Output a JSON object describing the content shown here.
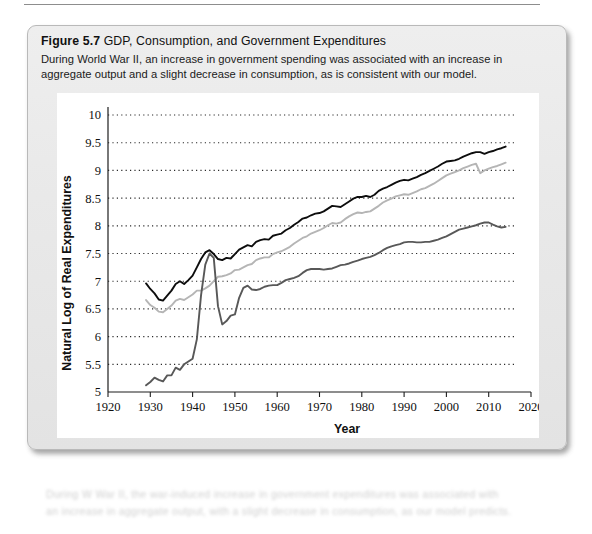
{
  "figure": {
    "number": "Figure 5.7",
    "title": "GDP, Consumption, and Government Expenditures",
    "description": "During World War II, an increase in government spending was associated with an increase in aggregate output and a slight decrease in consumption, as is consistent with our model."
  },
  "footer": {
    "line1": "During W War II, the war-induced increase in government expenditures was associated with",
    "line2": "an increase in aggregate output, with a slight decrease in consumption, as our model predicts."
  },
  "chart_data": {
    "type": "line",
    "title": "GDP, Consumption, and Government Expenditures",
    "xlabel": "Year",
    "ylabel": "Natural Log of Real Expenditures",
    "xlim": [
      1920,
      2020
    ],
    "ylim": [
      5,
      10
    ],
    "xticks": [
      1920,
      1930,
      1940,
      1950,
      1960,
      1970,
      1980,
      1990,
      2000,
      2010,
      2020
    ],
    "yticks": [
      5,
      5.5,
      6,
      6.5,
      7,
      7.5,
      8,
      8.5,
      9,
      9.5,
      10
    ],
    "grid": "horizontal-dotted",
    "legend": "none",
    "series": [
      {
        "name": "GDP",
        "color": "#0d0d0d",
        "width": 1.9,
        "x": [
          1929,
          1930,
          1931,
          1932,
          1933,
          1934,
          1935,
          1936,
          1937,
          1938,
          1939,
          1940,
          1941,
          1942,
          1943,
          1944,
          1945,
          1946,
          1947,
          1948,
          1949,
          1950,
          1951,
          1952,
          1953,
          1954,
          1955,
          1956,
          1957,
          1958,
          1959,
          1960,
          1961,
          1962,
          1963,
          1964,
          1965,
          1966,
          1967,
          1968,
          1969,
          1970,
          1971,
          1972,
          1973,
          1974,
          1975,
          1976,
          1977,
          1978,
          1979,
          1980,
          1981,
          1982,
          1983,
          1984,
          1985,
          1986,
          1987,
          1988,
          1989,
          1990,
          1991,
          1992,
          1993,
          1994,
          1995,
          1996,
          1997,
          1998,
          1999,
          2000,
          2001,
          2002,
          2003,
          2004,
          2005,
          2006,
          2007,
          2008,
          2009,
          2010,
          2011,
          2012,
          2013,
          2014
        ],
        "y": [
          6.96,
          6.86,
          6.78,
          6.67,
          6.65,
          6.74,
          6.83,
          6.95,
          7.0,
          6.95,
          7.02,
          7.1,
          7.25,
          7.4,
          7.52,
          7.56,
          7.49,
          7.4,
          7.38,
          7.42,
          7.41,
          7.49,
          7.57,
          7.61,
          7.65,
          7.63,
          7.71,
          7.74,
          7.76,
          7.75,
          7.82,
          7.84,
          7.86,
          7.92,
          7.96,
          8.02,
          8.07,
          8.13,
          8.15,
          8.19,
          8.22,
          8.23,
          8.26,
          8.31,
          8.36,
          8.35,
          8.34,
          8.39,
          8.44,
          8.49,
          8.52,
          8.52,
          8.54,
          8.52,
          8.56,
          8.63,
          8.67,
          8.7,
          8.74,
          8.78,
          8.81,
          8.83,
          8.82,
          8.85,
          8.88,
          8.92,
          8.95,
          8.99,
          9.03,
          9.07,
          9.12,
          9.16,
          9.17,
          9.18,
          9.21,
          9.25,
          9.28,
          9.31,
          9.33,
          9.33,
          9.3,
          9.33,
          9.35,
          9.38,
          9.4,
          9.43
        ]
      },
      {
        "name": "Consumption",
        "color": "#b5b5b5",
        "width": 1.9,
        "x": [
          1929,
          1930,
          1931,
          1932,
          1933,
          1934,
          1935,
          1936,
          1937,
          1938,
          1939,
          1940,
          1941,
          1942,
          1943,
          1944,
          1945,
          1946,
          1947,
          1948,
          1949,
          1950,
          1951,
          1952,
          1953,
          1954,
          1955,
          1956,
          1957,
          1958,
          1959,
          1960,
          1961,
          1962,
          1963,
          1964,
          1965,
          1966,
          1967,
          1968,
          1969,
          1970,
          1971,
          1972,
          1973,
          1974,
          1975,
          1976,
          1977,
          1978,
          1979,
          1980,
          1981,
          1982,
          1983,
          1984,
          1985,
          1986,
          1987,
          1988,
          1989,
          1990,
          1991,
          1992,
          1993,
          1994,
          1995,
          1996,
          1997,
          1998,
          1999,
          2000,
          2001,
          2002,
          2003,
          2004,
          2005,
          2006,
          2007,
          2008,
          2009,
          2010,
          2011,
          2012,
          2013,
          2014
        ],
        "y": [
          6.66,
          6.57,
          6.52,
          6.45,
          6.44,
          6.5,
          6.56,
          6.65,
          6.68,
          6.66,
          6.71,
          6.76,
          6.83,
          6.83,
          6.87,
          6.92,
          7.0,
          7.08,
          7.09,
          7.11,
          7.14,
          7.2,
          7.21,
          7.25,
          7.29,
          7.31,
          7.38,
          7.41,
          7.43,
          7.43,
          7.49,
          7.52,
          7.54,
          7.58,
          7.62,
          7.68,
          7.73,
          7.78,
          7.81,
          7.86,
          7.89,
          7.92,
          7.96,
          8.01,
          8.05,
          8.04,
          8.06,
          8.12,
          8.17,
          8.21,
          8.24,
          8.23,
          8.25,
          8.26,
          8.31,
          8.36,
          8.42,
          8.46,
          8.49,
          8.53,
          8.55,
          8.57,
          8.56,
          8.59,
          8.62,
          8.66,
          8.68,
          8.72,
          8.76,
          8.81,
          8.86,
          8.91,
          8.94,
          8.97,
          9.0,
          9.04,
          9.07,
          9.1,
          9.12,
          8.95,
          9.0,
          9.03,
          9.06,
          9.08,
          9.11,
          9.14
        ]
      },
      {
        "name": "Government Expenditures",
        "color": "#585858",
        "width": 1.9,
        "x": [
          1929,
          1930,
          1931,
          1932,
          1933,
          1934,
          1935,
          1936,
          1937,
          1938,
          1939,
          1940,
          1941,
          1942,
          1943,
          1944,
          1945,
          1946,
          1947,
          1948,
          1949,
          1950,
          1951,
          1952,
          1953,
          1954,
          1955,
          1956,
          1957,
          1958,
          1959,
          1960,
          1961,
          1962,
          1963,
          1964,
          1965,
          1966,
          1967,
          1968,
          1969,
          1970,
          1971,
          1972,
          1973,
          1974,
          1975,
          1976,
          1977,
          1978,
          1979,
          1980,
          1981,
          1982,
          1983,
          1984,
          1985,
          1986,
          1987,
          1988,
          1989,
          1990,
          1991,
          1992,
          1993,
          1994,
          1995,
          1996,
          1997,
          1998,
          1999,
          2000,
          2001,
          2002,
          2003,
          2004,
          2005,
          2006,
          2007,
          2008,
          2009,
          2010,
          2011,
          2012,
          2013,
          2014
        ],
        "y": [
          5.12,
          5.18,
          5.26,
          5.22,
          5.19,
          5.3,
          5.3,
          5.44,
          5.4,
          5.5,
          5.55,
          5.6,
          5.95,
          6.75,
          7.3,
          7.5,
          7.42,
          6.55,
          6.22,
          6.28,
          6.38,
          6.4,
          6.7,
          6.88,
          6.92,
          6.85,
          6.84,
          6.86,
          6.9,
          6.92,
          6.93,
          6.93,
          6.97,
          7.02,
          7.04,
          7.06,
          7.09,
          7.15,
          7.2,
          7.22,
          7.22,
          7.22,
          7.21,
          7.22,
          7.23,
          7.26,
          7.29,
          7.3,
          7.32,
          7.35,
          7.37,
          7.4,
          7.42,
          7.44,
          7.47,
          7.51,
          7.56,
          7.6,
          7.63,
          7.65,
          7.67,
          7.7,
          7.71,
          7.71,
          7.7,
          7.7,
          7.71,
          7.71,
          7.73,
          7.75,
          7.78,
          7.81,
          7.85,
          7.89,
          7.93,
          7.95,
          7.97,
          7.99,
          8.01,
          8.04,
          8.06,
          8.06,
          8.02,
          7.99,
          7.97,
          7.98
        ]
      }
    ]
  }
}
